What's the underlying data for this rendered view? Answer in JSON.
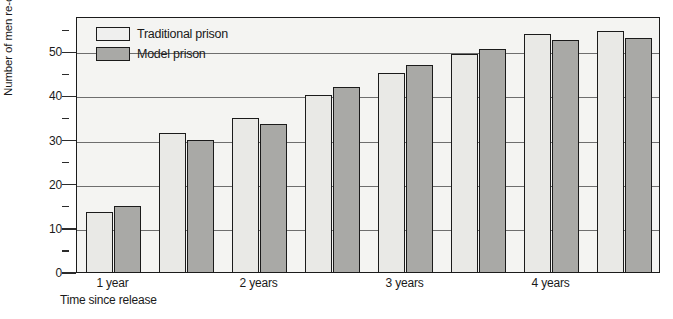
{
  "chart_data": {
    "type": "bar",
    "title": "",
    "xlabel": "Time since release",
    "ylabel": "Number of men re-convicted",
    "ylim": [
      0,
      58
    ],
    "yticks": [
      0,
      10,
      20,
      30,
      40,
      50
    ],
    "yticklabels": [
      "0",
      "10",
      "20",
      "30",
      "40",
      "50"
    ],
    "yminorticks": [
      5,
      15,
      25,
      35,
      45,
      55
    ],
    "grid": "horizontal-major",
    "legend_position": "top-left",
    "categories": [
      "1 year",
      "",
      "2 years",
      "",
      "3 years",
      "",
      "4 years",
      ""
    ],
    "xticklabels": [
      "1 year",
      "2 years",
      "3 years",
      "4 years"
    ],
    "series": [
      {
        "name": "Traditional prison",
        "color": "#e9e9e6",
        "values": [
          13.5,
          31.5,
          35,
          40,
          45,
          49.5,
          54,
          54.5
        ]
      },
      {
        "name": "Model prison",
        "color": "#a9a9a6",
        "values": [
          15,
          30,
          33.5,
          42,
          47,
          50.5,
          52.5,
          53
        ]
      }
    ]
  },
  "legend": {
    "items": [
      {
        "label": "Traditional prison",
        "swatch": "traditional"
      },
      {
        "label": "Model prison",
        "swatch": "model"
      }
    ]
  },
  "axes": {
    "y_title": "Number of men re-convicted",
    "x_title": "Time since release"
  }
}
